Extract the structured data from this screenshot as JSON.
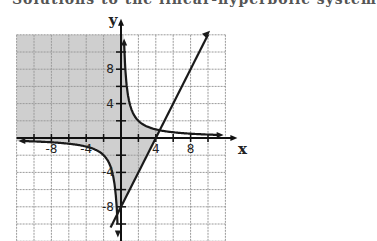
{
  "header": {
    "cut_off_text": "Solutions to the linear-hyperbolic system"
  },
  "chart_data": {
    "type": "line",
    "title": "",
    "xlabel": "x",
    "ylabel": "y",
    "xlim": [
      -12,
      12
    ],
    "ylim": [
      -12,
      12
    ],
    "grid": true,
    "grid_step": 2,
    "x_ticks": [
      -8,
      -4,
      4,
      8
    ],
    "y_ticks": [
      8,
      4,
      -4,
      -8
    ],
    "tick_labels": {
      "x": [
        "-8",
        "-4",
        "4",
        "8"
      ],
      "y": [
        "8",
        "4",
        "-4",
        "-8"
      ]
    },
    "series": [
      {
        "name": "line",
        "equation": "y = 2x - 8",
        "points": [
          [
            -1.2,
            -10.4
          ],
          [
            10,
            12
          ]
        ]
      },
      {
        "name": "hyperbola",
        "equation": "y = 4/x",
        "branches": [
          "x > 0",
          "x < 0"
        ]
      }
    ],
    "shaded_region": {
      "description": "y >= 2x - 8 and xy <= 4",
      "color": "#c8c8c8"
    },
    "intersection": [
      4.45,
      0.9
    ]
  },
  "colors": {
    "grid": "#9a9a9a",
    "curve": "#1a1a1a",
    "shade": "#cfcfcf"
  }
}
